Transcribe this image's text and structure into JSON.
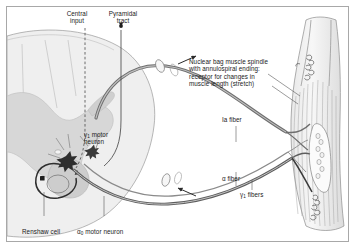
{
  "figure": {
    "domain": "diagram",
    "title_visible": false,
    "background_color": "#ffffff",
    "frame_color": "#a8a8a8",
    "ink_color": "#1a1a1a",
    "gray_matter_color": "#d7d7d7",
    "white_matter_color": "#efefef",
    "nerve_color": "#6e6e6e",
    "width": 356,
    "height": 249
  },
  "labels": {
    "central_input": "Central\ninput",
    "pyramidal_tract": "Pyramidal\ntract",
    "spindle_note_line1": "Nuclear bag muscle spindle",
    "spindle_note_line2": "with annulospiral ending:",
    "spindle_note_line3": "receptor for changes in",
    "spindle_note_line4": "muscle length (stretch)",
    "ia_fiber": "Ia fiber",
    "gamma_motor_neuron_line1": "motor",
    "gamma_motor_neuron_line2": "neuron",
    "gamma_motor_neuron_symbol": "γ",
    "gamma_motor_neuron_subscript": "1",
    "alpha_motor_neuron_text": "motor neuron",
    "alpha_motor_neuron_symbol": "α",
    "alpha_motor_neuron_subscript": "0",
    "renshaw_cell": "Renshaw cell",
    "alpha_fiber_symbol": "α",
    "alpha_fiber_text": "fiber",
    "gamma_fibers_symbol": "γ",
    "gamma_fibers_subscript": "1",
    "gamma_fibers_text": "fibers"
  },
  "structures": {
    "spinal_cord": "spinal-cord-cross-section",
    "gray_matter": "butterfly-gray-matter",
    "ventral_horn": "ventral-horn",
    "renshaw_loop": "renshaw-inhibitory-loop",
    "muscle": "skeletal-muscle-belly",
    "muscle_spindle": "nuclear-bag-muscle-spindle",
    "annulospiral_ending": "annulospiral-nerve-ending",
    "nerve_sheath_cuff_dorsal": "dorsal-root-sheath-cuff",
    "nerve_sheath_cuff_ventral": "ventral-root-sheath-cuff",
    "afferent_arrow": "afferent-direction-arrow",
    "efferent_arrow": "efferent-direction-arrow"
  }
}
